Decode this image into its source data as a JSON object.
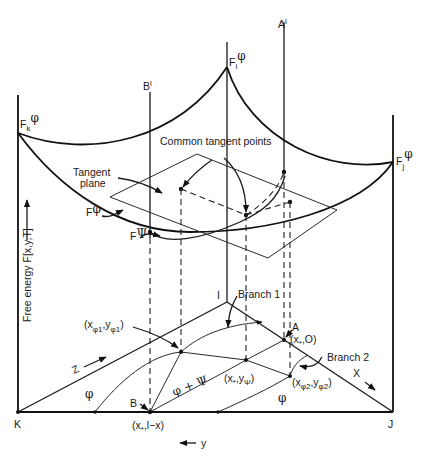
{
  "diagram": {
    "axis_label": "Free energy F[x,y,T]",
    "corners": {
      "K": "K",
      "J": "J",
      "I": "I"
    },
    "vertical_markers": {
      "B_prime": "B",
      "B_prime_sup": "l",
      "A_prime": "A",
      "A_prime_sup": "l"
    },
    "surface_labels": {
      "Fk": "F",
      "Fk_sub": "k",
      "Fk_sup": "φ",
      "Fi": "F",
      "Fi_sub": "i",
      "Fi_sup": "φ",
      "Fj": "F",
      "Fj_sub": "j",
      "Fj_sup": "φ",
      "F_phi": "F",
      "F_phi_sup": "φ",
      "F_psi": "F",
      "F_psi_sup": "Ψ"
    },
    "annotations": {
      "common_tangent_points": "Common tangent points",
      "tangent_plane_1": "Tangent",
      "tangent_plane_2": "plane",
      "branch1": "Branch 1",
      "branch2": "Branch 2"
    },
    "points": {
      "x_phi1_y_phi1": {
        "open": "(x",
        "s1": "φ1",
        "mid": ",y",
        "s2": "φ1",
        "close": ")"
      },
      "x_star_0": {
        "open": "(x",
        "s1": "*",
        "close": ",O)"
      },
      "x_star_y_psi": {
        "open": "(x",
        "s1": "*",
        "mid": ",y",
        "s2": "Ψ",
        "close": ")"
      },
      "x_phi2_y_phi2": {
        "open": "(x",
        "s1": "φ2",
        "mid": ",y",
        "s2": "φ2",
        "close": ")"
      },
      "x_star_1_minus_x": {
        "open": "(x",
        "s1": "*",
        "close": ",l−x)"
      },
      "A": "A",
      "B": "B"
    },
    "regions": {
      "phi_left": "φ",
      "phi_right": "φ",
      "phi_psi": "φ + Ψ"
    },
    "axes": {
      "z": "Z",
      "x": "X",
      "y": "y"
    }
  }
}
